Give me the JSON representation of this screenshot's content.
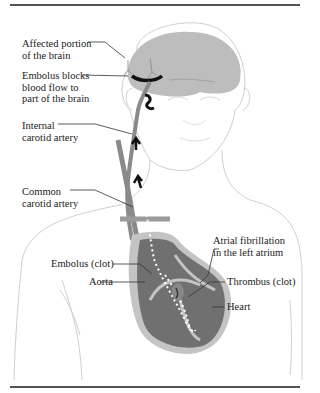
{
  "figure": {
    "labels": {
      "affected_portion": [
        "Affected portion",
        "of the brain"
      ],
      "embolus_blocks": [
        "Embolus blocks",
        "blood flow to",
        "part of the brain"
      ],
      "internal_carotid": [
        "Internal",
        "carotid artery"
      ],
      "common_carotid": [
        "Common",
        "carotid artery"
      ],
      "atrial_fibrillation": [
        "Atrial fibrillation",
        "in the left atrium"
      ],
      "embolus_clot": "Embolus (clot)",
      "aorta": "Aorta",
      "thrombus": "Thrombus (clot)",
      "heart": "Heart"
    },
    "colors": {
      "outline": "#c8c8c8",
      "brain": "#bdbdbd",
      "artery": "#8a8a8a",
      "heart_dark": "#6f6f6f",
      "heart_light": "#c4c4c4",
      "clot": "#111111",
      "leader": "#333333",
      "rule": "#555555"
    }
  }
}
